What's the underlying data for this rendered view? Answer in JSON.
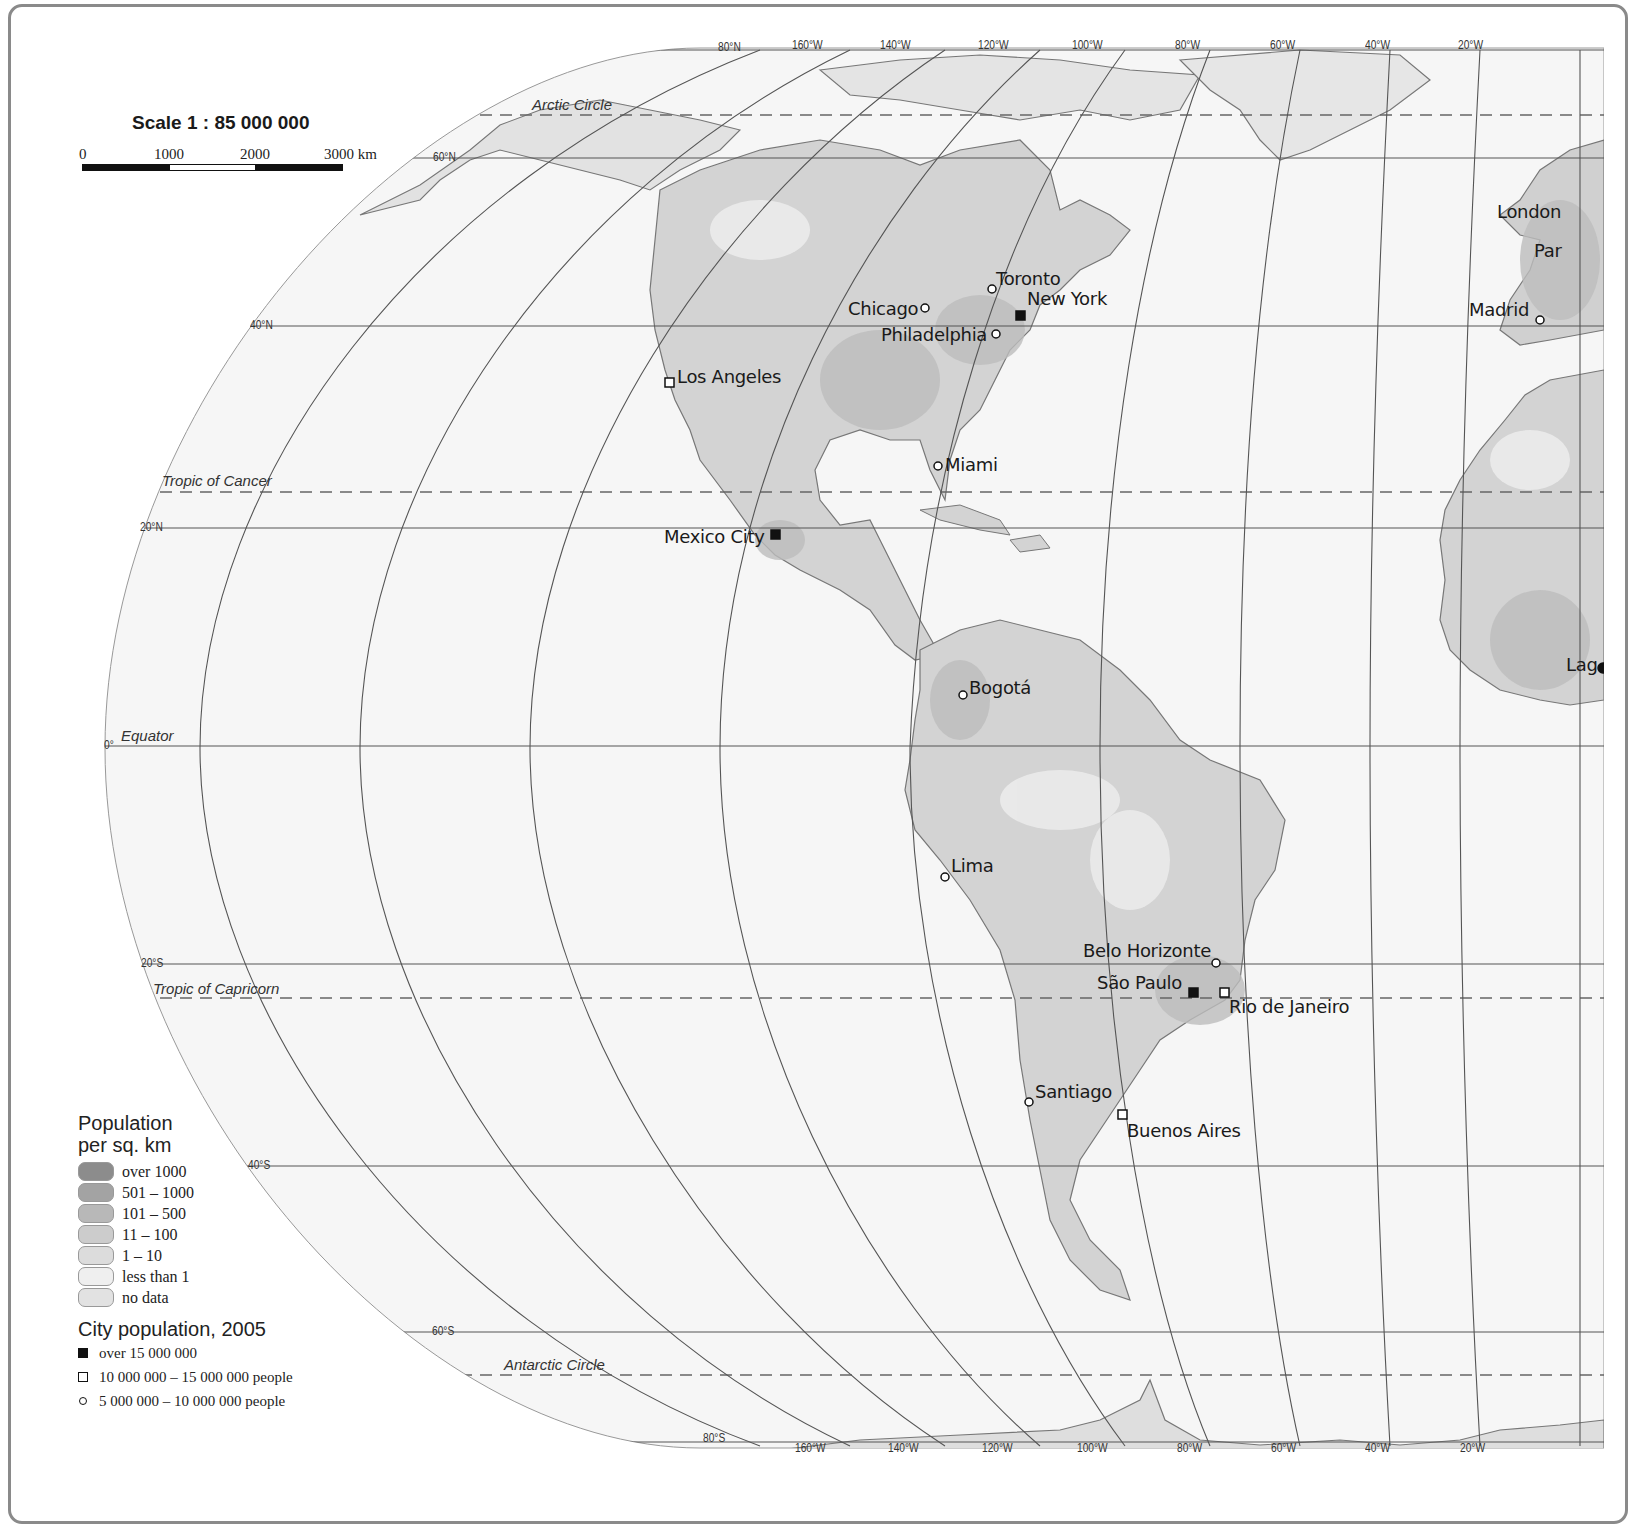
{
  "scale": {
    "title": "Scale 1 : 85 000 000",
    "ticks": [
      "0",
      "1000",
      "2000",
      "3000 km"
    ]
  },
  "geo_lines": {
    "arctic_circle": "Arctic Circle",
    "tropic_cancer": "Tropic of Cancer",
    "equator": "Equator",
    "tropic_capricorn": "Tropic of Capricorn",
    "antarctic_circle": "Antarctic Circle"
  },
  "latitudes": [
    "80°N",
    "60°N",
    "40°N",
    "20°N",
    "0°",
    "20°S",
    "40°S",
    "60°S",
    "80°S"
  ],
  "longitudes_top": [
    "160°W",
    "140°W",
    "120°W",
    "100°W",
    "80°W",
    "60°W",
    "40°W",
    "20°W"
  ],
  "longitudes_bottom": [
    "160°W",
    "140°W",
    "120°W",
    "100°W",
    "80°W",
    "60°W",
    "40°W",
    "20°W"
  ],
  "cities": [
    {
      "name": "Toronto",
      "size": "small"
    },
    {
      "name": "Chicago",
      "size": "small"
    },
    {
      "name": "New York",
      "size": "large"
    },
    {
      "name": "Philadelphia",
      "size": "small"
    },
    {
      "name": "Los Angeles",
      "size": "medium"
    },
    {
      "name": "Miami",
      "size": "small"
    },
    {
      "name": "Mexico City",
      "size": "large"
    },
    {
      "name": "Bogotá",
      "size": "small"
    },
    {
      "name": "Lima",
      "size": "small"
    },
    {
      "name": "Belo Horizonte",
      "size": "small"
    },
    {
      "name": "São Paulo",
      "size": "large"
    },
    {
      "name": "Rio de Janeiro",
      "size": "medium"
    },
    {
      "name": "Santiago",
      "size": "small"
    },
    {
      "name": "Buenos Aires",
      "size": "medium"
    },
    {
      "name": "London",
      "size": "partial"
    },
    {
      "name": "Par",
      "size": "partial"
    },
    {
      "name": "Madrid",
      "size": "small"
    },
    {
      "name": "Lag",
      "size": "partial"
    }
  ],
  "legend": {
    "density_title_1": "Population",
    "density_title_2": "per sq. km",
    "density_classes": [
      {
        "label": "over 1000",
        "color": "#8c8c8c"
      },
      {
        "label": "501 – 1000",
        "color": "#a3a3a3"
      },
      {
        "label": "101 – 500",
        "color": "#b8b8b8"
      },
      {
        "label": "11 – 100",
        "color": "#cccccc"
      },
      {
        "label": "1 – 10",
        "color": "#dcdcdc"
      },
      {
        "label": "less than 1",
        "color": "#e9e9e9"
      },
      {
        "label": "no data",
        "color": "#e2e2e2"
      }
    ],
    "city_title": "City population, 2005",
    "city_classes": [
      {
        "label": "over 15 000 000",
        "symbol": "filled-square"
      },
      {
        "label": "10 000 000 – 15 000 000 people",
        "symbol": "open-square"
      },
      {
        "label": "5 000 000 – 10 000 000 people",
        "symbol": "open-circle"
      }
    ]
  },
  "colors": {
    "ocean": "#f7f7f7",
    "land": "#d4d4d4",
    "land_dense": "#bdbdbd",
    "graticule": "#555555",
    "frame": "#8a8a8a"
  }
}
